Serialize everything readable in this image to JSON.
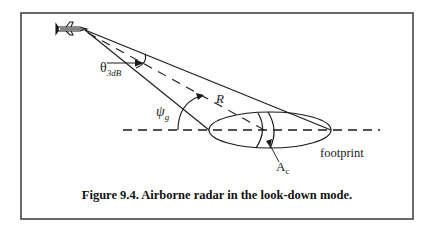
{
  "figure": {
    "caption": "Figure 9.4. Airborne radar in the look-down mode.",
    "labels": {
      "beamwidth_symbol": "θ",
      "beamwidth_subscript": "3dB",
      "range": "R",
      "grazing_symbol": "ψ",
      "grazing_subscript": "g",
      "clutter_area_symbol": "A",
      "clutter_area_subscript": "c",
      "footprint": "footprint"
    },
    "elements": [
      "aircraft",
      "antenna-beam",
      "beam-center-line",
      "ground-line",
      "footprint-ellipse",
      "clutter-cell"
    ],
    "colors": {
      "line": "#1a1a1a",
      "frame": "#444444",
      "background": "#ffffff"
    }
  }
}
